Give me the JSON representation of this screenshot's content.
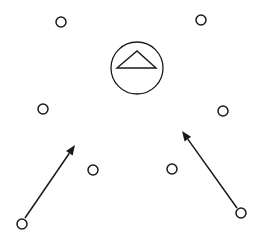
{
  "diagram": {
    "width": 261,
    "height": 239,
    "colors": {
      "stroke": "#1a1a1a",
      "background": "#ffffff"
    },
    "hub": {
      "shape": "circle-with-triangle",
      "cx": 137,
      "cy": 68,
      "r": 26,
      "triangle": [
        [
          117,
          68
        ],
        [
          137,
          51
        ],
        [
          156,
          68
        ]
      ]
    },
    "nodes": [
      {
        "id": "n1",
        "cx": 61,
        "cy": 22,
        "r": 5
      },
      {
        "id": "n2",
        "cx": 201,
        "cy": 20,
        "r": 5
      },
      {
        "id": "n3",
        "cx": 43,
        "cy": 109,
        "r": 5
      },
      {
        "id": "n4",
        "cx": 223,
        "cy": 111,
        "r": 5
      },
      {
        "id": "n5",
        "cx": 93,
        "cy": 170,
        "r": 5
      },
      {
        "id": "n6",
        "cx": 172,
        "cy": 169,
        "r": 5
      },
      {
        "id": "n7",
        "cx": 22,
        "cy": 224,
        "r": 5
      },
      {
        "id": "n8",
        "cx": 241,
        "cy": 213,
        "r": 5
      }
    ],
    "arrows": [
      {
        "id": "a-left",
        "x1": 25,
        "y1": 218,
        "x2": 75,
        "y2": 145
      },
      {
        "id": "a-right",
        "x1": 237,
        "y1": 208,
        "x2": 182,
        "y2": 131
      }
    ]
  }
}
